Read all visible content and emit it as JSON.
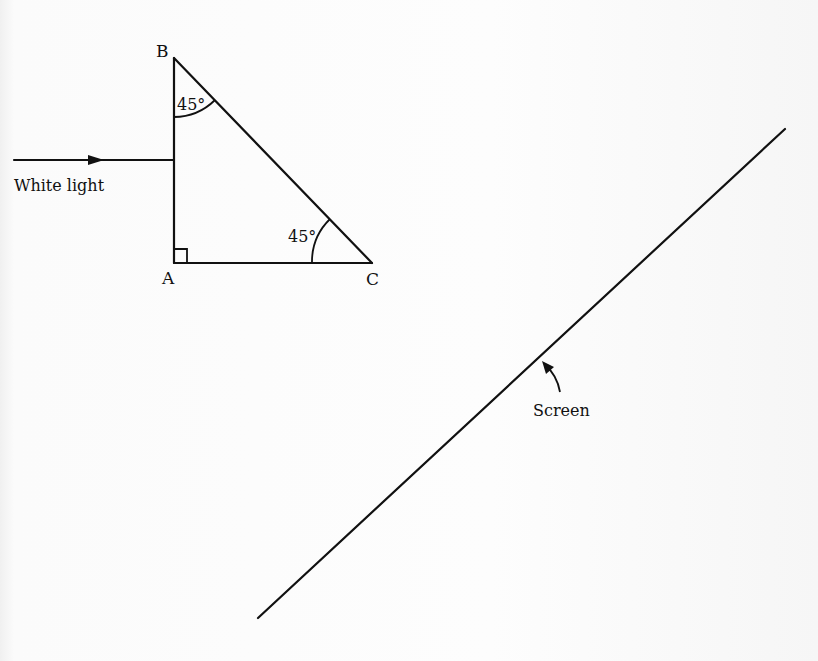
{
  "diagram": {
    "prism": {
      "vertices": {
        "A": {
          "label": "A",
          "x": 174,
          "y": 263
        },
        "B": {
          "label": "B",
          "x": 174,
          "y": 58
        },
        "C": {
          "label": "C",
          "x": 372,
          "y": 263
        }
      },
      "angles": {
        "B": {
          "label": "45°",
          "value": 45
        },
        "C": {
          "label": "45°",
          "value": 45
        },
        "A": {
          "label": "right angle",
          "value": 90
        }
      }
    },
    "incident_ray": {
      "label": "White light",
      "from": {
        "x": 14,
        "y": 160
      },
      "to": {
        "x": 174,
        "y": 160
      },
      "direction": "right"
    },
    "screen": {
      "label": "Screen",
      "from": {
        "x": 258,
        "y": 618
      },
      "to": {
        "x": 785,
        "y": 129
      }
    },
    "colors": {
      "ink": "#111111",
      "paper": "#fbfbfb"
    }
  }
}
